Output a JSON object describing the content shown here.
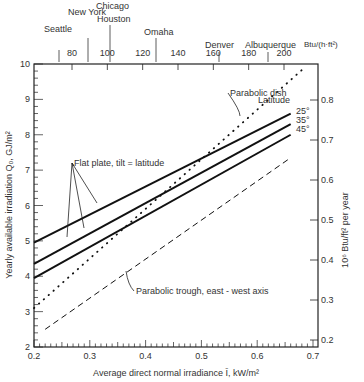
{
  "chart_data": {
    "type": "line",
    "title": "",
    "xlabel": "Average direct normal irradiance Ī, kW/m²",
    "ylabel": "Yearly available irradiation Q₀, GJ/m²",
    "y2label": "10⁶ Btu/ft² per year",
    "top_axis_unit": "Btu/(h·ft²)",
    "xlim": [
      0.2,
      0.7
    ],
    "ylim": [
      2,
      10
    ],
    "y2lim": [
      0.2,
      0.8
    ],
    "grid": false,
    "x_ticks": [
      "0.2",
      "0.3",
      "0.4",
      "0.5",
      "0.6",
      "0.7"
    ],
    "y_ticks": [
      "2",
      "3",
      "4",
      "5",
      "6",
      "7",
      "8",
      "9",
      "10"
    ],
    "y2_ticks": [
      "0.2",
      "0.3",
      "0.4",
      "0.5",
      "0.6",
      "0.7",
      "0.8"
    ],
    "top_ticks": [
      "80",
      "100",
      "120",
      "140",
      "160",
      "180",
      "200"
    ],
    "cities": [
      {
        "name": "Seattle",
        "value": 75
      },
      {
        "name": "New York",
        "value": 96
      },
      {
        "name": "Chicago",
        "value": 107
      },
      {
        "name": "Houston",
        "value": 107
      },
      {
        "name": "Omaha",
        "value": 128
      },
      {
        "name": "Denver",
        "value": 163
      },
      {
        "name": "Albuquerque",
        "value": 192
      }
    ],
    "series": [
      {
        "name": "Flat plate, tilt = latitude, 25°",
        "style": "solid",
        "x": [
          0.2,
          0.66
        ],
        "y": [
          4.95,
          8.6
        ]
      },
      {
        "name": "Flat plate, tilt = latitude, 35°",
        "style": "solid",
        "x": [
          0.2,
          0.66
        ],
        "y": [
          4.35,
          8.3
        ]
      },
      {
        "name": "Flat plate, tilt = latitude, 45°",
        "style": "solid",
        "x": [
          0.2,
          0.66
        ],
        "y": [
          3.95,
          8.0
        ]
      },
      {
        "name": "Parabolic dish",
        "style": "dotted",
        "x": [
          0.2,
          0.685
        ],
        "y": [
          3.1,
          9.9
        ]
      },
      {
        "name": "Parabolic trough, east-west axis",
        "style": "dashed",
        "x": [
          0.22,
          0.66
        ],
        "y": [
          2.5,
          7.35
        ]
      }
    ],
    "annotations": [
      "Flat plate, tilt = latitude",
      "Parabolic dish",
      "Parabolic trough, east - west axis",
      "Latitude",
      "25°",
      "35°",
      "45°"
    ]
  },
  "labels": {
    "xlabel": "Average direct normal irradiance Ī, kW/m²",
    "ylabel": "Yearly available irradiation Q₀, GJ/m²",
    "y2label": "10⁶ Btu/ft² per year",
    "top_unit": "Btu/(h·ft²)",
    "flat_plate": "Flat plate, tilt = latitude",
    "dish": "Parabolic dish",
    "trough": "Parabolic trough, east - west axis",
    "latitude": "Latitude",
    "lat25": "25°",
    "lat35": "35°",
    "lat45": "45°",
    "seattle": "Seattle",
    "newyork": "New York",
    "chicago": "Chicago",
    "houston": "Houston",
    "omaha": "Omaha",
    "denver": "Denver",
    "albuquerque": "Albuquerque"
  }
}
